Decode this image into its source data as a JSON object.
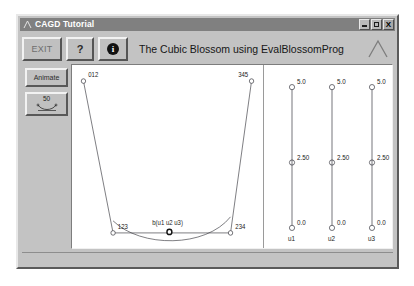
{
  "window": {
    "title": "CAGD Tutorial",
    "icon": "app-icon",
    "buttons": {
      "minimize": "minimize-icon",
      "maximize": "maximize-icon",
      "close": "X"
    }
  },
  "toolbar": {
    "exit_label": "EXIT",
    "help_label": "?",
    "info_label": "i",
    "title": "The Cubic Blossom using EvalBlossomProg",
    "logo": "lambda-logo"
  },
  "side_panel": {
    "animate_label": "Animate",
    "steps_value": "50",
    "steps_icon": "curve-icon"
  },
  "chart_data": {
    "type": "scatter",
    "title": "The Cubic Blossom using EvalBlossomProg",
    "xlabel": "",
    "ylabel": "",
    "control_points": [
      {
        "label": "012",
        "x": 12,
        "y": 16,
        "label_dx": 5,
        "label_dy": -4
      },
      {
        "label": "123",
        "x": 43,
        "y": 167,
        "label_dx": 5,
        "label_dy": -4
      },
      {
        "label": "234",
        "x": 166,
        "y": 167,
        "label_dx": 5,
        "label_dy": -4
      },
      {
        "label": "345",
        "x": 188,
        "y": 16,
        "label_dx": -14,
        "label_dy": -4
      }
    ],
    "polygon_path": "M12,16 L43,167 L166,167 L188,16",
    "curve_path": "M43,155 C72,182 140,182 166,151",
    "blossom_point": {
      "label": "b(u1 u2 u3)",
      "x": 102,
      "y": 166,
      "label_dx": -18,
      "label_dy": -7
    }
  },
  "sliders": [
    {
      "name": "u1",
      "top_value": "5.0",
      "mid_value": "2.50",
      "bottom_value": "0.0",
      "cx": 28
    },
    {
      "name": "u2",
      "top_value": "5.0",
      "mid_value": "2.50",
      "bottom_value": "0.0",
      "cx": 68
    },
    {
      "name": "u3",
      "top_value": "5.0",
      "mid_value": "2.50",
      "bottom_value": "0.0",
      "cx": 108
    }
  ]
}
